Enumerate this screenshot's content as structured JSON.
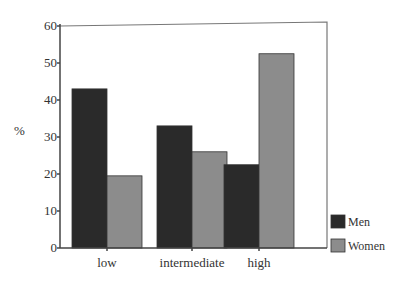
{
  "chart_data": {
    "type": "bar",
    "title": "",
    "xlabel": "",
    "ylabel": "%",
    "ylim": [
      0,
      60
    ],
    "yticks": [
      0,
      10,
      20,
      30,
      40,
      50,
      60
    ],
    "categories": [
      "low",
      "intermediate",
      "high"
    ],
    "series": [
      {
        "name": "Men",
        "color": "#2a2a2a",
        "values": [
          43,
          33,
          22.5
        ]
      },
      {
        "name": "Women",
        "color": "#8c8c8c",
        "values": [
          19.5,
          26,
          52.5
        ]
      }
    ],
    "grid": false,
    "legend_position": "bottom-right outside plot"
  },
  "colors": {
    "men": "#2a2a2a",
    "women": "#8c8c8c",
    "axis": "#444444",
    "frame": "#777777"
  }
}
